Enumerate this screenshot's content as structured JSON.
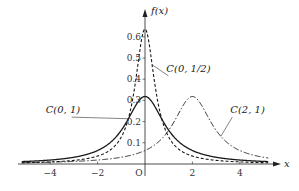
{
  "chart_data": {
    "type": "line",
    "title": "",
    "xlabel": "x",
    "ylabel": "f(x)",
    "xlim": [
      -5.4,
      5.6
    ],
    "ylim": [
      0,
      0.68
    ],
    "grid": false,
    "legend": "inline annotations",
    "x_ticks": [
      -4,
      -2,
      2,
      4
    ],
    "x_tick_labels": [
      "−4",
      "−2",
      "2",
      "4"
    ],
    "origin_label": "O",
    "y_ticks": [
      0.1,
      0.2,
      0.3,
      0.4,
      0.5,
      0.6
    ],
    "y_tick_labels": [
      "0.1",
      "0.2",
      "0.3",
      "0.4",
      "0.5",
      "0.6"
    ],
    "series": [
      {
        "name": "C(0, 1)",
        "x0": 0,
        "gamma": 1,
        "style": "solid",
        "peak": 0.318,
        "label": {
          "text": "C(0, 1)",
          "x": -3.6,
          "y": 0.24,
          "pointer_to_x": -0.7
        }
      },
      {
        "name": "C(0, 1/2)",
        "x0": 0,
        "gamma": 0.5,
        "style": "dashed",
        "peak": 0.637,
        "label": {
          "text": "C(0, 1/2)",
          "x": 0.9,
          "y": 0.435,
          "pointer_to_x": 0.3
        }
      },
      {
        "name": "C(2, 1)",
        "x0": 2,
        "gamma": 1,
        "style": "dashdot",
        "peak": 0.318,
        "label": {
          "text": "C(2, 1)",
          "x": 3.6,
          "y": 0.24,
          "pointer_to_x": 3.2
        }
      }
    ],
    "x_range": [
      -5.2,
      5.2
    ]
  },
  "axes": {
    "x_label": "x",
    "y_label": "f(x)",
    "origin": "O"
  }
}
